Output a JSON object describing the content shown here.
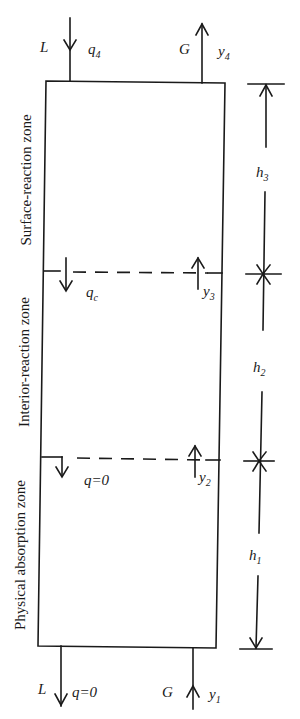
{
  "diagram": {
    "type": "column-zone-schematic",
    "top_streams": {
      "liquid_in": {
        "name": "L",
        "concentration": "q",
        "subscript": "4"
      },
      "gas_out": {
        "name": "G",
        "concentration": "y",
        "subscript": "4"
      }
    },
    "bottom_streams": {
      "liquid_out": {
        "name": "L",
        "concentration_label": "q=0"
      },
      "gas_in": {
        "name": "G",
        "concentration": "y",
        "subscript": "1"
      }
    },
    "interfaces": [
      {
        "liquid_label": "q",
        "liquid_sub": "c",
        "gas_label": "y",
        "gas_sub": "3"
      },
      {
        "liquid_label": "q=0",
        "liquid_sub": "",
        "gas_label": "y",
        "gas_sub": "2"
      }
    ],
    "zones": [
      {
        "name": "Surface-reaction zone",
        "height_label": "h",
        "height_sub": "3"
      },
      {
        "name": "Interior-reaction zone",
        "height_label": "h",
        "height_sub": "2"
      },
      {
        "name": "Physical absorption zone",
        "height_label": "h",
        "height_sub": "1"
      }
    ]
  }
}
